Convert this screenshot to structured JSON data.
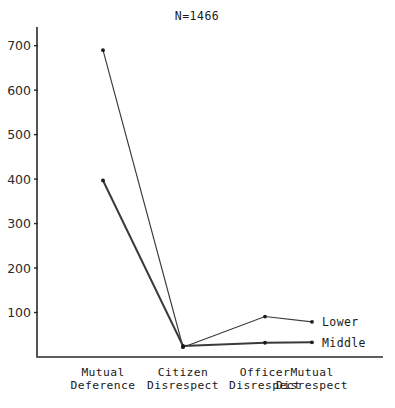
{
  "chart_data": {
    "type": "line",
    "title": "N=1466",
    "xlabel": "",
    "ylabel": "",
    "categories": [
      "Mutual Deference",
      "Citizen Disrespect",
      "Officer Disrespect",
      "Mutual Disrespect"
    ],
    "category_lines": [
      [
        "Mutual",
        "Deference"
      ],
      [
        "Citizen",
        "Disrespect"
      ],
      [
        "Officer",
        "Disrespect"
      ],
      [
        "Mutual",
        "Disrespect"
      ]
    ],
    "series": [
      {
        "name": "Lower",
        "values": [
          690,
          22,
          91,
          79
        ]
      },
      {
        "name": "Middle",
        "values": [
          397,
          25,
          32,
          33
        ]
      }
    ],
    "yticks": [
      700,
      600,
      500,
      400,
      300,
      200,
      100
    ],
    "ylim": [
      0,
      742
    ],
    "grid": false,
    "legend_position": "right",
    "legend": [
      "Lower",
      "Middle"
    ],
    "colors": {
      "axis": "#2b2b2b",
      "lower": "#3a3a3a",
      "middle": "#3a3a3a"
    }
  }
}
